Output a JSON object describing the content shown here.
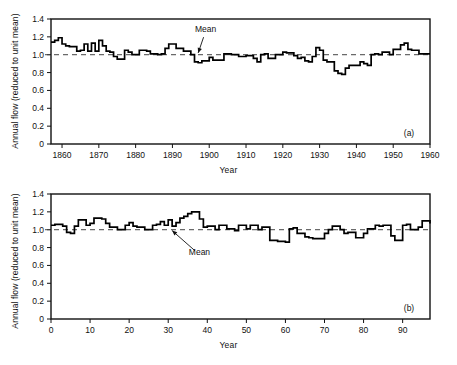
{
  "figure": {
    "background": "#ffffff",
    "ink_color": "#000000",
    "mean_line_color": "#444444"
  },
  "chart_data": [
    {
      "id": "panel-a",
      "type": "line",
      "subtype": "step",
      "title": "",
      "panel_tag": "(a)",
      "xlabel": "Year",
      "ylabel": "Annual flow (reduced to unit mean)",
      "xlim": [
        1857,
        1960
      ],
      "ylim": [
        0,
        1.4
      ],
      "grid": false,
      "legend": "none",
      "xticks": [
        1860,
        1870,
        1880,
        1890,
        1900,
        1910,
        1920,
        1930,
        1940,
        1950,
        1960
      ],
      "xtick_labels": [
        "1860",
        "1870",
        "1880",
        "1890",
        "1900",
        "1910",
        "1920",
        "1930",
        "1940",
        "1950",
        "1960"
      ],
      "yticks": [
        0,
        0.2,
        0.4,
        0.6,
        0.8,
        1.0,
        1.2,
        1.4
      ],
      "ytick_labels": [
        "0",
        "0.2",
        "0.4",
        "0.6",
        "0.8",
        "1.0",
        "1.2",
        "1.4"
      ],
      "annotations": [
        {
          "text": "Mean",
          "x": 1899,
          "y": 1.26,
          "points_to_x": 1897,
          "points_to_y": 1.02
        }
      ],
      "reference_lines": [
        {
          "name": "Mean",
          "orientation": "horizontal",
          "y": 1.0,
          "style": "dashed"
        }
      ],
      "x": [
        1857,
        1858,
        1859,
        1860,
        1861,
        1862,
        1863,
        1864,
        1865,
        1866,
        1867,
        1868,
        1869,
        1870,
        1871,
        1872,
        1873,
        1874,
        1875,
        1876,
        1877,
        1878,
        1879,
        1880,
        1881,
        1882,
        1883,
        1884,
        1885,
        1886,
        1887,
        1888,
        1889,
        1890,
        1891,
        1892,
        1893,
        1894,
        1895,
        1896,
        1897,
        1898,
        1899,
        1900,
        1901,
        1902,
        1903,
        1904,
        1905,
        1906,
        1907,
        1908,
        1909,
        1910,
        1911,
        1912,
        1913,
        1914,
        1915,
        1916,
        1917,
        1918,
        1919,
        1920,
        1921,
        1922,
        1923,
        1924,
        1925,
        1926,
        1927,
        1928,
        1929,
        1930,
        1931,
        1932,
        1933,
        1934,
        1935,
        1936,
        1937,
        1938,
        1939,
        1940,
        1941,
        1942,
        1943,
        1944,
        1945,
        1946,
        1947,
        1948,
        1949,
        1950,
        1951,
        1952,
        1953,
        1954,
        1955,
        1956,
        1957,
        1958,
        1959,
        1960
      ],
      "y": [
        1.14,
        1.16,
        1.19,
        1.12,
        1.1,
        1.09,
        1.09,
        1.04,
        1.05,
        1.12,
        1.04,
        1.13,
        1.04,
        1.16,
        1.1,
        1.04,
        1.03,
        0.98,
        0.95,
        0.95,
        1.05,
        1.03,
        1.0,
        1.0,
        1.05,
        1.05,
        1.04,
        1.01,
        1.01,
        1.0,
        1.01,
        1.07,
        1.12,
        1.12,
        1.07,
        1.07,
        1.04,
        1.04,
        1.0,
        0.92,
        0.91,
        0.93,
        0.93,
        0.97,
        0.94,
        0.94,
        0.94,
        1.01,
        1.01,
        1.0,
        1.0,
        0.98,
        0.98,
        0.99,
        0.99,
        0.96,
        0.92,
        1.0,
        1.01,
        0.96,
        0.96,
        1.0,
        1.0,
        1.03,
        1.02,
        1.02,
        0.99,
        0.96,
        0.97,
        0.93,
        0.92,
        0.98,
        1.08,
        1.05,
        0.94,
        0.92,
        0.92,
        0.82,
        0.79,
        0.78,
        0.85,
        0.88,
        0.88,
        0.88,
        0.92,
        0.9,
        0.88,
        1.0,
        1.01,
        1.0,
        1.03,
        1.03,
        1.0,
        1.06,
        1.06,
        1.11,
        1.13,
        1.06,
        1.05,
        1.05,
        1.01,
        1.01,
        1.01,
        1.01
      ]
    },
    {
      "id": "panel-b",
      "type": "line",
      "subtype": "step",
      "title": "",
      "panel_tag": "(b)",
      "xlabel": "Year",
      "ylabel": "Annual flow (reduced to unit mean)",
      "xlim": [
        0,
        97
      ],
      "ylim": [
        0,
        1.4
      ],
      "grid": false,
      "legend": "none",
      "xticks": [
        0,
        10,
        20,
        30,
        40,
        50,
        60,
        70,
        80,
        90
      ],
      "xtick_labels": [
        "0",
        "10",
        "20",
        "30",
        "40",
        "50",
        "60",
        "70",
        "80",
        "90"
      ],
      "yticks": [
        0,
        0.2,
        0.4,
        0.6,
        0.8,
        1.0,
        1.2,
        1.4
      ],
      "ytick_labels": [
        "0",
        "0.2",
        "0.4",
        "0.6",
        "0.8",
        "1.0",
        "1.2",
        "1.4"
      ],
      "annotations": [
        {
          "text": "Mean",
          "x": 38,
          "y": 0.72,
          "points_to_x": 31,
          "points_to_y": 0.99
        }
      ],
      "reference_lines": [
        {
          "name": "Mean",
          "orientation": "horizontal",
          "y": 1.0,
          "style": "dashed"
        }
      ],
      "x": [
        0,
        1,
        2,
        3,
        4,
        5,
        6,
        7,
        8,
        9,
        10,
        11,
        12,
        13,
        14,
        15,
        16,
        17,
        18,
        19,
        20,
        21,
        22,
        23,
        24,
        25,
        26,
        27,
        28,
        29,
        30,
        31,
        32,
        33,
        34,
        35,
        36,
        37,
        38,
        39,
        40,
        41,
        42,
        43,
        44,
        45,
        46,
        47,
        48,
        49,
        50,
        51,
        52,
        53,
        54,
        55,
        56,
        57,
        58,
        59,
        60,
        61,
        62,
        63,
        64,
        65,
        66,
        67,
        68,
        69,
        70,
        71,
        72,
        73,
        74,
        75,
        76,
        77,
        78,
        79,
        80,
        81,
        82,
        83,
        84,
        85,
        86,
        87,
        88,
        89,
        90,
        91,
        92,
        93,
        94,
        95,
        96,
        97
      ],
      "y": [
        1.05,
        1.06,
        1.06,
        1.04,
        0.97,
        0.96,
        1.04,
        1.11,
        1.11,
        1.05,
        1.07,
        1.13,
        1.13,
        1.12,
        1.07,
        1.03,
        1.03,
        1.0,
        1.0,
        1.05,
        1.08,
        1.04,
        1.03,
        1.03,
        1.0,
        1.0,
        1.05,
        1.06,
        1.09,
        1.05,
        1.11,
        1.04,
        1.08,
        1.13,
        1.15,
        1.18,
        1.2,
        1.2,
        1.12,
        1.03,
        1.04,
        1.04,
        1.0,
        1.05,
        1.05,
        1.01,
        1.01,
        0.99,
        1.05,
        1.05,
        1.01,
        1.05,
        1.05,
        1.0,
        1.03,
        1.03,
        0.88,
        0.88,
        0.87,
        0.87,
        0.86,
        1.01,
        1.02,
        0.96,
        0.96,
        0.92,
        0.91,
        0.9,
        0.9,
        0.9,
        0.96,
        1.0,
        1.04,
        1.04,
        1.0,
        0.96,
        0.97,
        0.97,
        0.91,
        0.91,
        0.96,
        1.01,
        1.01,
        1.05,
        1.04,
        1.05,
        1.05,
        0.93,
        0.88,
        0.88,
        1.05,
        1.06,
        1.0,
        1.0,
        1.03,
        1.1,
        1.1,
        1.07
      ]
    }
  ]
}
